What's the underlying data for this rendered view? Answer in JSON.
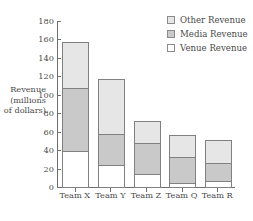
{
  "chart_data": {
    "type": "bar",
    "stacked": true,
    "title": "",
    "xlabel": "",
    "ylabel": "Revenue (millions of dollars)",
    "ylabel_lines": [
      "Revenue",
      "(millions",
      "of dollars)"
    ],
    "categories": [
      "Team X",
      "Team Y",
      "Team Z",
      "Team Q",
      "Team R"
    ],
    "series": [
      {
        "name": "Venue Revenue",
        "color": "#ffffff",
        "values": [
          40,
          25,
          15,
          5,
          8
        ]
      },
      {
        "name": "Media Revenue",
        "color": "#c9c9c9",
        "values": [
          70,
          35,
          35,
          30,
          20
        ]
      },
      {
        "name": "Other Revenue",
        "color": "#e6e6e6",
        "values": [
          50,
          60,
          25,
          25,
          26
        ]
      }
    ],
    "stack_order_bottom_to_top": [
      "Venue Revenue",
      "Media Revenue",
      "Other Revenue"
    ],
    "totals": [
      160,
      120,
      75,
      60,
      54
    ],
    "ylim": [
      0,
      180
    ],
    "yticks": [
      0,
      20,
      40,
      60,
      80,
      100,
      120,
      140,
      160,
      180
    ],
    "ytick_labels": [
      "0",
      "20",
      "40",
      "60",
      "80",
      "100",
      "120",
      "140",
      "160",
      "180"
    ],
    "grid": false,
    "legend_position": "top-right",
    "legend": [
      {
        "label": "Other Revenue",
        "color": "#e6e6e6"
      },
      {
        "label": "Media Revenue",
        "color": "#c9c9c9"
      },
      {
        "label": "Venue Revenue",
        "color": "#ffffff"
      }
    ],
    "colors": {
      "axis": "#6e6e6e",
      "bar_outline": "#808080",
      "text": "#4a4a4a",
      "background": "#ffffff"
    }
  }
}
